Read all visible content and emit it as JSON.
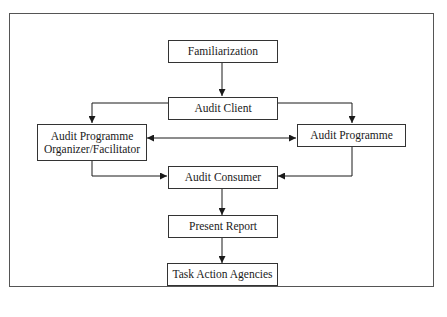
{
  "diagram": {
    "type": "flowchart",
    "nodes": {
      "familiarization": "Familiarization",
      "audit_client": "Audit Client",
      "organizer": "Audit Programme Organizer/Facilitator",
      "organizer_line1": "Audit Programme",
      "organizer_line2": "Organizer/Facilitator",
      "audit_programme": "Audit Programme",
      "audit_consumer": "Audit Consumer",
      "present_report": "Present Report",
      "task_action_agencies": "Task Action Agencies"
    },
    "edges": [
      {
        "from": "Familiarization",
        "to": "Audit Client"
      },
      {
        "from": "Audit Client",
        "to": "Audit Programme Organizer/Facilitator"
      },
      {
        "from": "Audit Client",
        "to": "Audit Programme"
      },
      {
        "from": "Audit Programme Organizer/Facilitator",
        "to": "Audit Programme",
        "bidirectional": true
      },
      {
        "from": "Audit Programme Organizer/Facilitator",
        "to": "Audit Consumer"
      },
      {
        "from": "Audit Programme",
        "to": "Audit Consumer"
      },
      {
        "from": "Audit Consumer",
        "to": "Present Report"
      },
      {
        "from": "Present Report",
        "to": "Task Action Agencies"
      }
    ],
    "colors": {
      "line": "#1a1a1a",
      "frame": "#555555",
      "background": "#ffffff"
    }
  }
}
